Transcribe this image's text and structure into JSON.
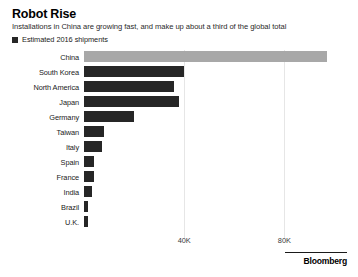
{
  "header": {
    "title": "Robot Rise",
    "subtitle": "Installations in China are growing fast, and make up about a third of the global total"
  },
  "legend": {
    "swatch_color": "#262626",
    "label": "Estimated 2016 shipments"
  },
  "footer": {
    "brand": "Bloomberg"
  },
  "chart_data": {
    "type": "bar",
    "orientation": "horizontal",
    "title": "Robot Rise",
    "subtitle": "Installations in China are growing fast, and make up about a third of the global total",
    "series_name": "Estimated 2016 shipments",
    "xlabel": "",
    "ylabel": "",
    "categories": [
      "China",
      "South Korea",
      "North America",
      "Japan",
      "Germany",
      "Taiwan",
      "Italy",
      "Spain",
      "France",
      "India",
      "Brazil",
      "U.K."
    ],
    "values": [
      97000,
      40000,
      36000,
      38000,
      20000,
      8000,
      7000,
      4000,
      4000,
      3000,
      1500,
      1500
    ],
    "xlim": [
      0,
      105000
    ],
    "xticks": [
      40000,
      80000
    ],
    "xticklabels": [
      "40K",
      "80K"
    ],
    "grid": "vertical",
    "legend_position": "top-left",
    "highlight_category": "China",
    "highlight_color": "#a8a8a8",
    "bar_color": "#262626"
  }
}
